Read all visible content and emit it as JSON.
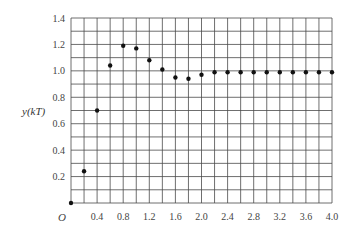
{
  "chart_data": {
    "type": "scatter",
    "title": "",
    "xlabel": "",
    "ylabel": "y(kT)",
    "origin_label": "O",
    "xlim": [
      0,
      4.0
    ],
    "ylim": [
      0,
      1.4
    ],
    "grid": true,
    "x_grid_step": 0.2,
    "y_grid_step": 0.1,
    "x_ticks": [
      "0.4",
      "0.8",
      "1.2",
      "1.6",
      "2.0",
      "2.4",
      "2.8",
      "3.2",
      "3.6",
      "4.0"
    ],
    "y_ticks": [
      "0.2",
      "0.4",
      "0.6",
      "0.8",
      "1.0",
      "1.2",
      "1.4"
    ],
    "series": [
      {
        "name": "y(kT)",
        "x": [
          0.0,
          0.2,
          0.4,
          0.6,
          0.8,
          1.0,
          1.2,
          1.4,
          1.6,
          1.8,
          2.0,
          2.2,
          2.4,
          2.6,
          2.8,
          3.0,
          3.2,
          3.4,
          3.6,
          3.8,
          4.0
        ],
        "values": [
          0.0,
          0.24,
          0.7,
          1.04,
          1.19,
          1.17,
          1.08,
          1.01,
          0.95,
          0.94,
          0.97,
          0.99,
          0.99,
          0.99,
          0.99,
          0.99,
          0.99,
          0.99,
          0.99,
          0.99,
          0.99
        ]
      }
    ],
    "colors": {
      "grid": "#4a4a4a",
      "point": "#111111",
      "text": "#444444"
    }
  }
}
